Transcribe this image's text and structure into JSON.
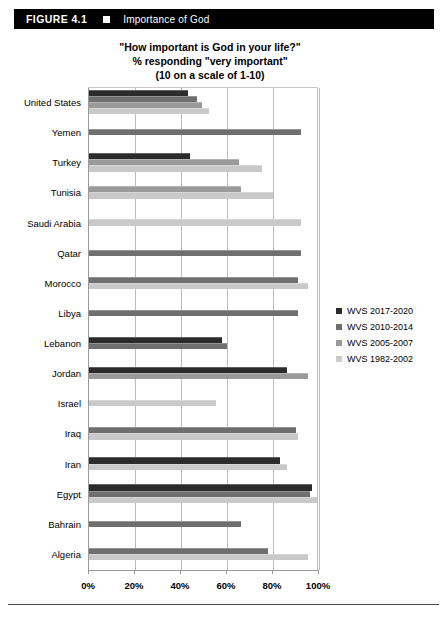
{
  "figure": {
    "number_label": "FIGURE 4.1",
    "marker_icon": "white-square-icon",
    "title": "Importance of God"
  },
  "chart_title": {
    "line1": "\"How important is God in your life?\"",
    "line2": "% responding \"very important\"",
    "line3": "(10 on a scale of 1-10)"
  },
  "legend": {
    "items": [
      {
        "label": "WVS 2017-2020",
        "color": "#2b2b2b"
      },
      {
        "label": "WVS 2010-2014",
        "color": "#6f6f6f"
      },
      {
        "label": "WVS 2005-2007",
        "color": "#9a9a9a"
      },
      {
        "label": "WVS 1982-2002",
        "color": "#c9c9c9"
      }
    ]
  },
  "axis": {
    "x_tick_labels": [
      "0%",
      "20%",
      "40%",
      "60%",
      "80%",
      "100%"
    ],
    "x_tick_values": [
      0,
      20,
      40,
      60,
      80,
      100
    ]
  },
  "chart_data": {
    "type": "bar",
    "orientation": "horizontal",
    "title": "\"How important is God in your life?\" % responding \"very important\" (10 on a scale of 1-10)",
    "xlabel": "",
    "ylabel": "",
    "xlim": [
      0,
      100
    ],
    "xticks": [
      0,
      20,
      40,
      60,
      80,
      100
    ],
    "xtick_labels": [
      "0%",
      "20%",
      "40%",
      "60%",
      "80%",
      "100%"
    ],
    "grid": true,
    "legend_position": "right",
    "categories": [
      "United States",
      "Yemen",
      "Turkey",
      "Tunisia",
      "Saudi Arabia",
      "Qatar",
      "Morocco",
      "Libya",
      "Lebanon",
      "Jordan",
      "Israel",
      "Iraq",
      "Iran",
      "Egypt",
      "Bahrain",
      "Algeria"
    ],
    "series": [
      {
        "name": "WVS 2017-2020",
        "color": "#2b2b2b",
        "values": [
          43,
          null,
          44,
          null,
          null,
          null,
          null,
          null,
          58,
          86,
          null,
          null,
          83,
          97,
          null,
          null
        ]
      },
      {
        "name": "WVS 2010-2014",
        "color": "#6f6f6f",
        "values": [
          47,
          92,
          null,
          null,
          null,
          92,
          91,
          91,
          60,
          null,
          null,
          90,
          null,
          96,
          66,
          78
        ]
      },
      {
        "name": "WVS 2005-2007",
        "color": "#9a9a9a",
        "values": [
          49,
          null,
          65,
          66,
          null,
          null,
          null,
          null,
          null,
          95,
          null,
          null,
          null,
          null,
          null,
          null
        ]
      },
      {
        "name": "WVS 1982-2002",
        "color": "#c9c9c9",
        "values": [
          52,
          null,
          75,
          80,
          92,
          null,
          95,
          null,
          null,
          null,
          55,
          91,
          86,
          99,
          null,
          95
        ]
      }
    ]
  }
}
